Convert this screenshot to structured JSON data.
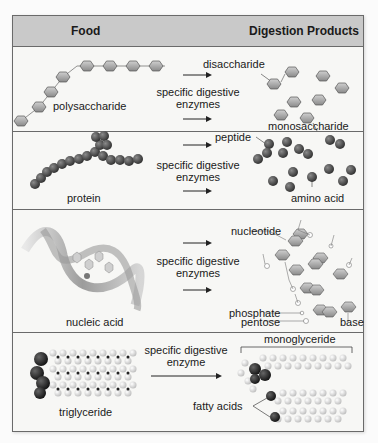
{
  "header": {
    "food": "Food",
    "products": "Digestion Products"
  },
  "rows": [
    {
      "food_label": "polysaccharide",
      "enzyme_line1": "specific digestive",
      "enzyme_line2": "enzymes",
      "products": [
        "disaccharide",
        "monosaccharide"
      ]
    },
    {
      "food_label": "protein",
      "enzyme_line1": "specific digestive",
      "enzyme_line2": "enzymes",
      "products": [
        "peptide",
        "amino acid"
      ]
    },
    {
      "food_label": "nucleic acid",
      "enzyme_line1": "specific digestive",
      "enzyme_line2": "enzymes",
      "products": [
        "nucleotide",
        "phosphate",
        "pentose",
        "base"
      ]
    },
    {
      "food_label": "triglyceride",
      "enzyme_line1": "specific digestive",
      "enzyme_line2": "enzyme",
      "products": [
        "monoglyceride",
        "fatty acids"
      ]
    }
  ],
  "colors": {
    "header_bg": "#c9c9c9",
    "border": "#6a6a6a",
    "sugar_fill": "#a8a8a8",
    "amino_fill": "#4a4a4a"
  }
}
